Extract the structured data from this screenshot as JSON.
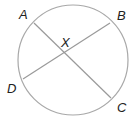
{
  "diagram": {
    "type": "circle-with-intersecting-chords",
    "colors": {
      "stroke": "#9a9a9a",
      "label": "#222222",
      "background": "#ffffff"
    },
    "points": {
      "A": {
        "label": "A"
      },
      "B": {
        "label": "B"
      },
      "C": {
        "label": "C"
      },
      "D": {
        "label": "D"
      },
      "X": {
        "label": "X"
      }
    },
    "chords": [
      {
        "name": "AC",
        "from": "A",
        "to": "C"
      },
      {
        "name": "BD",
        "from": "B",
        "to": "D"
      }
    ],
    "intersection": "X"
  }
}
